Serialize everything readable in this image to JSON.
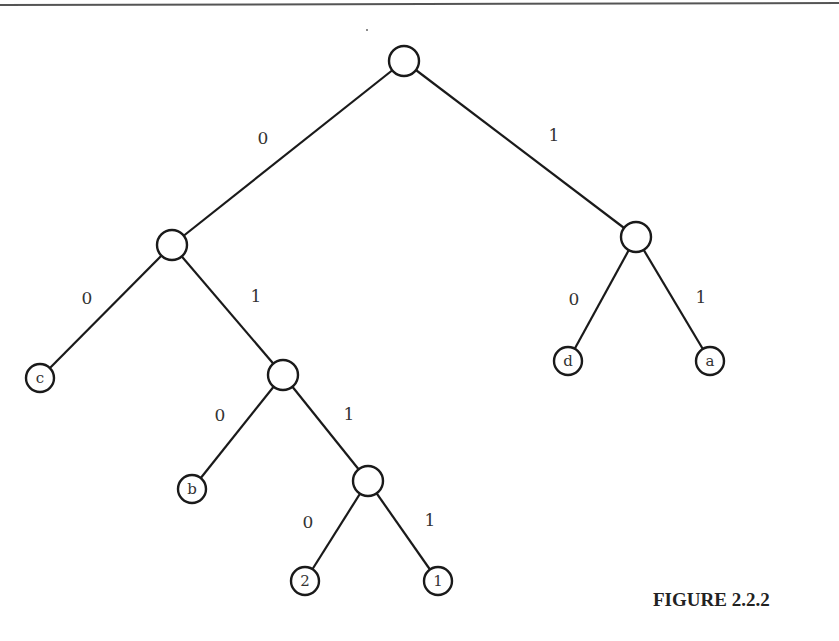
{
  "figure": {
    "caption": "FIGURE 2.2.2",
    "caption_pos": {
      "x": 653,
      "y": 606
    },
    "top_rule": {
      "x1": 0,
      "y1": 5,
      "x2": 839,
      "y2": 3
    }
  },
  "tree": {
    "node_radius": 15,
    "leaf_radius": 14,
    "nodes": [
      {
        "id": "root",
        "x": 404,
        "y": 61,
        "label": "",
        "leaf": false
      },
      {
        "id": "n0",
        "x": 172,
        "y": 245,
        "label": "",
        "leaf": false
      },
      {
        "id": "n1",
        "x": 636,
        "y": 237,
        "label": "",
        "leaf": false
      },
      {
        "id": "c",
        "x": 40,
        "y": 378,
        "label": "c",
        "leaf": true
      },
      {
        "id": "n01",
        "x": 283,
        "y": 375,
        "label": "",
        "leaf": false
      },
      {
        "id": "d",
        "x": 568,
        "y": 361,
        "label": "d",
        "leaf": true
      },
      {
        "id": "a",
        "x": 710,
        "y": 361,
        "label": "a",
        "leaf": true
      },
      {
        "id": "b",
        "x": 192,
        "y": 489,
        "label": "b",
        "leaf": true
      },
      {
        "id": "n011",
        "x": 368,
        "y": 481,
        "label": "",
        "leaf": false
      },
      {
        "id": "two",
        "x": 305,
        "y": 581,
        "label": "2",
        "leaf": true
      },
      {
        "id": "one",
        "x": 438,
        "y": 581,
        "label": "1",
        "leaf": true
      }
    ],
    "edges": [
      {
        "from": "root",
        "to": "n0",
        "label": "0",
        "lx": 263,
        "ly": 138
      },
      {
        "from": "root",
        "to": "n1",
        "label": "1",
        "lx": 554,
        "ly": 135
      },
      {
        "from": "n0",
        "to": "c",
        "label": "0",
        "lx": 87,
        "ly": 298
      },
      {
        "from": "n0",
        "to": "n01",
        "label": "1",
        "lx": 256,
        "ly": 296
      },
      {
        "from": "n1",
        "to": "d",
        "label": "0",
        "lx": 574,
        "ly": 299
      },
      {
        "from": "n1",
        "to": "a",
        "label": "1",
        "lx": 701,
        "ly": 297
      },
      {
        "from": "n01",
        "to": "b",
        "label": "0",
        "lx": 220,
        "ly": 415
      },
      {
        "from": "n01",
        "to": "n011",
        "label": "1",
        "lx": 349,
        "ly": 414
      },
      {
        "from": "n011",
        "to": "two",
        "label": "0",
        "lx": 308,
        "ly": 522
      },
      {
        "from": "n011",
        "to": "one",
        "label": "1",
        "lx": 430,
        "ly": 520
      }
    ]
  }
}
